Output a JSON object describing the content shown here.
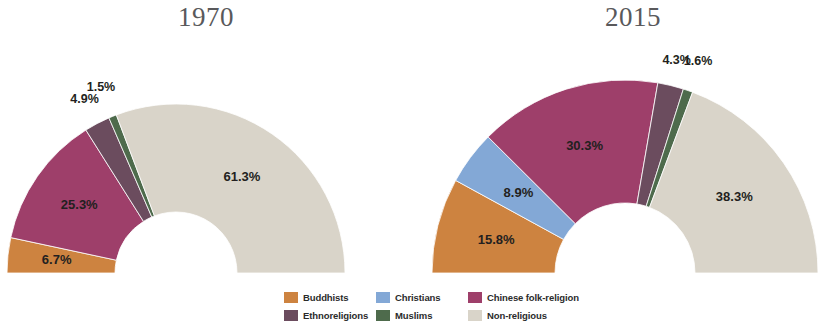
{
  "figure": {
    "background_color": "#ffffff"
  },
  "charts": [
    {
      "id": "chart-1970",
      "title": "1970",
      "labels": [
        "6.7%",
        "25.3%",
        "4.9%",
        "1.5%",
        "61.3%"
      ]
    },
    {
      "id": "chart-2015",
      "title": "2015",
      "labels": [
        "15.8%",
        "8.9%",
        "30.3%",
        "4.3%",
        "1.6%",
        "38.3%"
      ]
    }
  ],
  "legend": {
    "items": [
      {
        "label": "Buddhists",
        "color": "#cd8340",
        "swatch_name": "legend-swatch-buddhists"
      },
      {
        "label": "Ethnoreligions",
        "color": "#6b4c5e",
        "swatch_name": "legend-swatch-ethnoreligions"
      },
      {
        "label": "Christians",
        "color": "#83a8d6",
        "swatch_name": "legend-swatch-christians"
      },
      {
        "label": "Muslims",
        "color": "#4e6b4c",
        "swatch_name": "legend-swatch-muslims"
      },
      {
        "label": "Chinese folk-religion",
        "color": "#9e3f6a",
        "swatch_name": "legend-swatch-chinese-folk-religion"
      },
      {
        "label": "Non-religious",
        "color": "#d9d4c9",
        "swatch_name": "legend-swatch-non-religious"
      }
    ]
  },
  "chart_data": [
    {
      "type": "pie",
      "variant": "half-donut",
      "title": "1970",
      "xlabel": "",
      "ylabel": "",
      "legend_position": "bottom-center",
      "grid": false,
      "categories": [
        "Buddhists",
        "Chinese folk-religion",
        "Ethnoreligions",
        "Muslims",
        "Non-religious"
      ],
      "values": [
        6.7,
        25.3,
        4.9,
        1.5,
        61.3
      ],
      "labels": [
        "6.7%",
        "25.3%",
        "4.9%",
        "1.5%",
        "61.3%"
      ],
      "colors": [
        "#cd8340",
        "#9e3f6a",
        "#6b4c5e",
        "#4e6b4c",
        "#d9d4c9"
      ]
    },
    {
      "type": "pie",
      "variant": "half-donut",
      "title": "2015",
      "xlabel": "",
      "ylabel": "",
      "legend_position": "bottom-center",
      "grid": false,
      "categories": [
        "Buddhists",
        "Christians",
        "Chinese folk-religion",
        "Ethnoreligions",
        "Muslims",
        "Non-religious"
      ],
      "values": [
        15.8,
        8.9,
        30.3,
        4.3,
        1.6,
        38.3
      ],
      "labels": [
        "15.8%",
        "8.9%",
        "30.3%",
        "4.3%",
        "1.6%",
        "38.3%"
      ],
      "colors": [
        "#cd8340",
        "#83a8d6",
        "#9e3f6a",
        "#6b4c5e",
        "#4e6b4c",
        "#d9d4c9"
      ]
    }
  ]
}
